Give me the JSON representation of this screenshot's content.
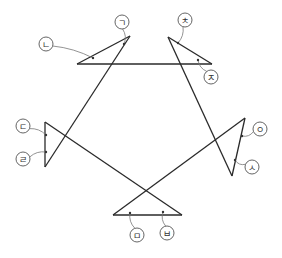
{
  "diagram": {
    "lines": [
      {
        "from": [
          77,
          64
        ],
        "to": [
          212,
          64
        ]
      },
      {
        "from": [
          77,
          64
        ],
        "to": [
          130,
          36
        ]
      },
      {
        "from": [
          130,
          36
        ],
        "to": [
          45,
          167
        ]
      },
      {
        "from": [
          168,
          37
        ],
        "to": [
          212,
          64
        ]
      },
      {
        "from": [
          168,
          37
        ],
        "to": [
          232,
          176
        ]
      },
      {
        "from": [
          45,
          122
        ],
        "to": [
          45,
          167
        ]
      },
      {
        "from": [
          45,
          122
        ],
        "to": [
          182,
          215
        ]
      },
      {
        "from": [
          245,
          118
        ],
        "to": [
          232,
          176
        ]
      },
      {
        "from": [
          245,
          118
        ],
        "to": [
          113,
          215
        ]
      },
      {
        "from": [
          113,
          215
        ],
        "to": [
          182,
          215
        ]
      }
    ],
    "labels": [
      {
        "id": "giyeok",
        "text": "ㄱ",
        "x": 122,
        "y": 22,
        "anchor": [
          124,
          44
        ]
      },
      {
        "id": "nieun",
        "text": "ㄴ",
        "x": 46,
        "y": 44,
        "anchor": [
          93,
          58
        ]
      },
      {
        "id": "chieut",
        "text": "ㅊ",
        "x": 185,
        "y": 20,
        "anchor": [
          178,
          43
        ]
      },
      {
        "id": "jieut",
        "text": "ㅈ",
        "x": 211,
        "y": 77,
        "anchor": [
          198,
          60
        ]
      },
      {
        "id": "digeut",
        "text": "ㄷ",
        "x": 23,
        "y": 126,
        "anchor": [
          46,
          135
        ]
      },
      {
        "id": "rieul",
        "text": "ㄹ",
        "x": 23,
        "y": 159,
        "anchor": [
          46,
          152
        ]
      },
      {
        "id": "ieung",
        "text": "ㅇ",
        "x": 260,
        "y": 129,
        "anchor": [
          242,
          136
        ]
      },
      {
        "id": "siot",
        "text": "ㅅ",
        "x": 252,
        "y": 167,
        "anchor": [
          235,
          160
        ]
      },
      {
        "id": "mieum",
        "text": "ㅁ",
        "x": 137,
        "y": 235,
        "anchor": [
          130,
          213
        ]
      },
      {
        "id": "bieup",
        "text": "ㅂ",
        "x": 167,
        "y": 233,
        "anchor": [
          163,
          212
        ]
      }
    ]
  }
}
